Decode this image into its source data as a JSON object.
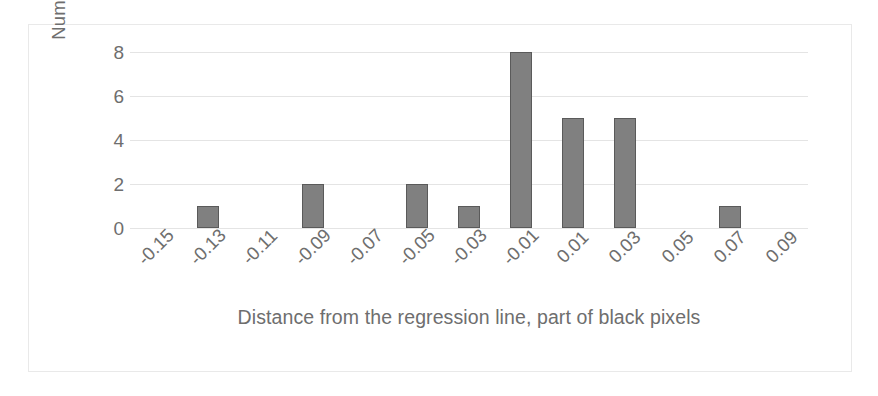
{
  "chart_data": {
    "type": "bar",
    "title": "",
    "subtitle": "",
    "xlabel": "Distance from the regression line, part of black pixels",
    "ylabel": "Number of cases",
    "categories": [
      "-0.15",
      "-0.13",
      "-0.11",
      "-0.09",
      "-0.07",
      "-0.05",
      "-0.03",
      "-0.01",
      "0.01",
      "0.03",
      "0.05",
      "0.07",
      "0.09"
    ],
    "values": [
      0,
      1,
      0,
      2,
      0,
      2,
      1,
      8,
      5,
      5,
      0,
      1,
      0
    ],
    "ylim": [
      0,
      8
    ],
    "yticks": [
      0,
      2,
      4,
      6,
      8
    ],
    "ytick_labels": [
      "0",
      "2",
      "4",
      "6",
      "8"
    ],
    "grid": true,
    "grid_axis": "y",
    "legend": false,
    "legend_position": "none",
    "bar_fill_color": "#808080",
    "bar_border_color": "#5a5a5a",
    "gridline_color": "#e4e4e4",
    "text_color": "#6e6e6e",
    "frame_color": "#e9e9e9",
    "background_color": "#ffffff",
    "xtick_rotation": -45
  }
}
